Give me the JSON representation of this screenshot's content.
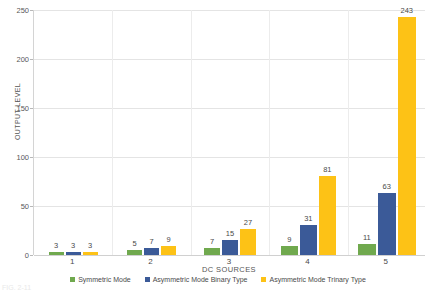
{
  "chart_data": {
    "type": "bar",
    "title": "",
    "xlabel": "DC SOURCES",
    "ylabel": "OUTPUT LEVEL",
    "categories": [
      "1",
      "2",
      "3",
      "4",
      "5"
    ],
    "ylim": [
      0,
      250
    ],
    "yticks": [
      0,
      50,
      100,
      150,
      200,
      250
    ],
    "grid": true,
    "legend_position": "bottom",
    "series": [
      {
        "name": "Symmetric Mode",
        "color": "#70a94e",
        "values": [
          3,
          5,
          7,
          9,
          11
        ]
      },
      {
        "name": "Asymmetric Mode  Binary Type",
        "color": "#3b5a98",
        "values": [
          3,
          7,
          15,
          31,
          63
        ]
      },
      {
        "name": "Asymmetric Mode Trinary Type",
        "color": "#fdc216",
        "values": [
          3,
          9,
          27,
          81,
          243
        ]
      }
    ]
  },
  "caption": "FIG. 2-11"
}
